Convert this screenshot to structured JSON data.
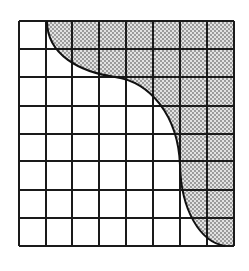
{
  "diagram": {
    "type": "grid-with-shaded-region",
    "grid": {
      "columns": 8,
      "rows": 8,
      "x_lines": [
        19,
        46,
        72,
        99,
        126,
        153,
        180,
        207,
        234
      ],
      "y_lines": [
        21,
        49,
        77,
        106,
        134,
        161,
        190,
        218,
        246
      ],
      "line_color": "#1a1a1a",
      "line_width": 2
    },
    "curve": {
      "description": "S-shaped boundary curve from top edge to bottom edge",
      "path": "M47,21 C47,55 80,72 115,77 C150,82 178,115 180,165 C181,210 200,242 225,246",
      "stroke_color": "#111111",
      "stroke_width": 2
    },
    "shaded_region": {
      "description": "Stippled region to the upper-right of the curve",
      "path": "M47,21 C47,55 80,72 115,77 C150,82 178,115 180,165 C181,210 200,242 225,246 L234,246 L234,21 Z",
      "fill_background": "#d8d8d8",
      "dot_color": "#7a7a7a",
      "pattern": "stipple-dots"
    },
    "background": "#ffffff"
  }
}
